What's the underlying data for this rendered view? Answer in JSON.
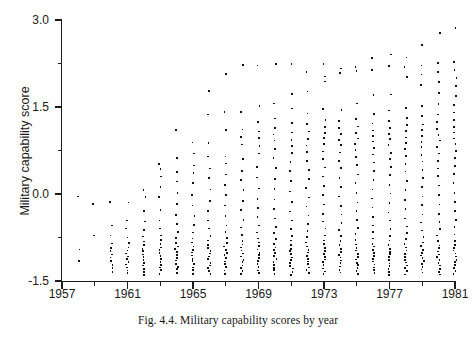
{
  "figure": {
    "caption": "Fig. 4.4. Military capability scores by year",
    "axis_color": "#1c1c1c",
    "dot_color": "#111111",
    "background": "#ffffff"
  },
  "chart_data": {
    "type": "scatter",
    "title": "",
    "xlabel": "",
    "ylabel": "Military capability score",
    "xlim": [
      1957,
      1981
    ],
    "ylim": [
      -1.5,
      3.0
    ],
    "grid": false,
    "legend": null,
    "x_major_ticks": [
      1957,
      1961,
      1965,
      1969,
      1973,
      1977,
      1981
    ],
    "x_major_tick_labels": [
      "1957",
      "1961",
      "1965",
      "1969",
      "1973",
      "1977",
      "1981"
    ],
    "x_minor_ticks": [
      1959,
      1963,
      1967,
      1971,
      1975,
      1979
    ],
    "y_major_ticks": [
      -1.5,
      0.0,
      1.5,
      3.0
    ],
    "y_major_tick_labels": [
      "-1.5",
      "0.0",
      "1.5",
      "3.0"
    ],
    "y_minor_ticks": [
      -0.75,
      0.75,
      2.25
    ],
    "series": [
      {
        "name": "Military capability score",
        "marker": "dot",
        "points_by_year": [
          {
            "year": 1958,
            "values": [
              -0.05,
              -0.95,
              -1.15
            ]
          },
          {
            "year": 1959,
            "values": [
              -0.17,
              -0.72
            ]
          },
          {
            "year": 1960,
            "values": [
              -0.13,
              -0.55,
              -0.72,
              -0.85,
              -0.92,
              -0.98,
              -1.04,
              -1.1,
              -1.16,
              -1.22,
              -1.28,
              -1.34
            ]
          },
          {
            "year": 1961,
            "values": [
              -0.15,
              -0.45,
              -0.6,
              -0.75,
              -0.85,
              -0.92,
              -0.98,
              -1.02,
              -1.07,
              -1.12,
              -1.17,
              -1.22,
              -1.27,
              -1.32,
              -1.37
            ]
          },
          {
            "year": 1962,
            "values": [
              0.07,
              -0.05,
              -0.3,
              -0.48,
              -0.62,
              -0.74,
              -0.82,
              -0.88,
              -0.94,
              -0.99,
              -1.04,
              -1.09,
              -1.14,
              -1.19,
              -1.24,
              -1.29,
              -1.34,
              -1.39
            ]
          },
          {
            "year": 1963,
            "values": [
              0.52,
              0.42,
              0.3,
              0.13,
              -0.06,
              -0.28,
              -0.46,
              -0.6,
              -0.72,
              -0.8,
              -0.86,
              -0.92,
              -0.97,
              -1.02,
              -1.07,
              -1.12,
              -1.17,
              -1.22,
              -1.27,
              -1.32,
              -1.38
            ]
          },
          {
            "year": 1964,
            "values": [
              1.1,
              0.62,
              0.38,
              0.22,
              0.02,
              -0.18,
              -0.36,
              -0.52,
              -0.66,
              -0.76,
              -0.84,
              -0.9,
              -0.95,
              -1.0,
              -1.05,
              -1.1,
              -1.15,
              -1.2,
              -1.25,
              -1.3,
              -1.36
            ]
          },
          {
            "year": 1965,
            "values": [
              0.88,
              0.7,
              0.5,
              0.35,
              0.18,
              -0.02,
              -0.2,
              -0.38,
              -0.54,
              -0.66,
              -0.76,
              -0.84,
              -0.9,
              -0.96,
              -1.01,
              -1.06,
              -1.11,
              -1.16,
              -1.21,
              -1.26,
              -1.31,
              -1.37
            ]
          },
          {
            "year": 1966,
            "values": [
              1.78,
              1.38,
              0.88,
              0.64,
              0.44,
              0.27,
              0.08,
              -0.12,
              -0.3,
              -0.46,
              -0.6,
              -0.72,
              -0.8,
              -0.87,
              -0.93,
              -0.98,
              -1.03,
              -1.08,
              -1.13,
              -1.18,
              -1.23,
              -1.28,
              -1.33,
              -1.38
            ]
          },
          {
            "year": 1967,
            "values": [
              2.08,
              1.42,
              1.1,
              0.65,
              0.52,
              0.34,
              0.16,
              -0.02,
              -0.2,
              -0.38,
              -0.54,
              -0.66,
              -0.76,
              -0.84,
              -0.9,
              -0.96,
              -1.01,
              -1.06,
              -1.11,
              -1.16,
              -1.21,
              -1.26,
              -1.31,
              -1.37
            ]
          },
          {
            "year": 1968,
            "values": [
              2.22,
              1.42,
              1.12,
              0.98,
              0.86,
              0.6,
              0.4,
              0.24,
              0.06,
              -0.12,
              -0.28,
              -0.44,
              -0.58,
              -0.7,
              -0.8,
              -0.87,
              -0.93,
              -0.98,
              -1.03,
              -1.08,
              -1.13,
              -1.18,
              -1.23,
              -1.28,
              -1.33,
              -1.38
            ]
          },
          {
            "year": 1969,
            "values": [
              2.22,
              1.52,
              1.24,
              1.08,
              0.96,
              0.82,
              0.7,
              0.46,
              0.28,
              0.1,
              -0.08,
              -0.24,
              -0.4,
              -0.54,
              -0.66,
              -0.76,
              -0.84,
              -0.9,
              -0.96,
              -1.01,
              -1.06,
              -1.11,
              -1.16,
              -1.21,
              -1.26,
              -1.31,
              -1.37
            ]
          },
          {
            "year": 1970,
            "values": [
              2.24,
              1.56,
              1.3,
              1.14,
              1.02,
              0.92,
              0.78,
              0.62,
              0.44,
              0.26,
              0.08,
              -0.1,
              -0.26,
              -0.42,
              -0.56,
              -0.68,
              -0.78,
              -0.86,
              -0.92,
              -0.97,
              -1.02,
              -1.07,
              -1.12,
              -1.17,
              -1.22,
              -1.27,
              -1.32,
              -1.38
            ]
          },
          {
            "year": 1971,
            "values": [
              2.24,
              1.72,
              1.48,
              1.22,
              1.06,
              0.94,
              0.82,
              0.7,
              0.56,
              0.4,
              0.22,
              0.04,
              -0.14,
              -0.3,
              -0.46,
              -0.6,
              -0.72,
              -0.81,
              -0.88,
              -0.94,
              -0.99,
              -1.04,
              -1.09,
              -1.14,
              -1.19,
              -1.24,
              -1.29,
              -1.34,
              -1.39
            ]
          },
          {
            "year": 1972,
            "values": [
              2.1,
              1.76,
              1.38,
              1.2,
              1.08,
              0.96,
              0.84,
              0.72,
              0.58,
              0.42,
              0.26,
              0.1,
              -0.06,
              -0.22,
              -0.38,
              -0.52,
              -0.64,
              -0.74,
              -0.83,
              -0.9,
              -0.96,
              -1.01,
              -1.06,
              -1.11,
              -1.16,
              -1.21,
              -1.26,
              -1.31,
              -1.36
            ]
          },
          {
            "year": 1973,
            "values": [
              2.24,
              2.02,
              1.94,
              1.46,
              1.28,
              1.16,
              1.06,
              0.96,
              0.86,
              0.74,
              0.6,
              0.46,
              0.3,
              0.14,
              -0.02,
              -0.18,
              -0.34,
              -0.48,
              -0.6,
              -0.71,
              -0.8,
              -0.87,
              -0.93,
              -0.98,
              -1.03,
              -1.08,
              -1.13,
              -1.18,
              -1.23,
              -1.28,
              -1.33,
              -1.38
            ]
          },
          {
            "year": 1974,
            "values": [
              2.16,
              2.08,
              1.44,
              1.26,
              1.14,
              1.04,
              0.94,
              0.84,
              0.72,
              0.58,
              0.44,
              0.28,
              0.12,
              -0.04,
              -0.2,
              -0.36,
              -0.5,
              -0.62,
              -0.73,
              -0.82,
              -0.89,
              -0.95,
              -1.0,
              -1.05,
              -1.1,
              -1.15,
              -1.2,
              -1.25,
              -1.3,
              -1.35
            ]
          },
          {
            "year": 1975,
            "values": [
              2.18,
              2.12,
              1.56,
              1.3,
              1.16,
              1.06,
              0.96,
              0.86,
              0.76,
              0.64,
              0.5,
              0.34,
              0.18,
              0.02,
              -0.14,
              -0.3,
              -0.44,
              -0.58,
              -0.7,
              -0.8,
              -0.87,
              -0.93,
              -0.98,
              -1.03,
              -1.08,
              -1.13,
              -1.18,
              -1.23,
              -1.28,
              -1.33,
              -1.38
            ]
          },
          {
            "year": 1976,
            "values": [
              2.34,
              2.14,
              1.7,
              1.38,
              1.22,
              1.1,
              1.0,
              0.9,
              0.8,
              0.68,
              0.54,
              0.4,
              0.24,
              0.08,
              -0.08,
              -0.24,
              -0.4,
              -0.54,
              -0.66,
              -0.77,
              -0.85,
              -0.91,
              -0.97,
              -1.02,
              -1.07,
              -1.12,
              -1.17,
              -1.22,
              -1.27,
              -1.32,
              -1.37
            ]
          },
          {
            "year": 1977,
            "values": [
              2.4,
              2.2,
              1.72,
              1.44,
              1.26,
              1.14,
              1.04,
              0.94,
              0.84,
              0.72,
              0.6,
              0.46,
              0.32,
              0.16,
              0.0,
              -0.16,
              -0.32,
              -0.46,
              -0.6,
              -0.72,
              -0.81,
              -0.88,
              -0.94,
              -0.99,
              -1.04,
              -1.09,
              -1.14,
              -1.19,
              -1.24,
              -1.29,
              -1.34,
              -1.39
            ]
          },
          {
            "year": 1978,
            "values": [
              2.36,
              2.18,
              2.02,
              1.48,
              1.3,
              1.18,
              1.08,
              0.98,
              0.88,
              0.78,
              0.66,
              0.52,
              0.38,
              0.22,
              0.06,
              -0.1,
              -0.26,
              -0.42,
              -0.56,
              -0.68,
              -0.78,
              -0.86,
              -0.92,
              -0.98,
              -1.03,
              -1.08,
              -1.13,
              -1.18,
              -1.23,
              -1.28,
              -1.33,
              -1.38
            ]
          },
          {
            "year": 1979,
            "values": [
              2.56,
              2.22,
              2.06,
              1.88,
              1.52,
              1.34,
              1.2,
              1.1,
              1.0,
              0.9,
              0.8,
              0.68,
              0.56,
              0.42,
              0.28,
              0.12,
              -0.04,
              -0.2,
              -0.36,
              -0.5,
              -0.63,
              -0.74,
              -0.83,
              -0.9,
              -0.96,
              -1.01,
              -1.06,
              -1.11,
              -1.16,
              -1.21,
              -1.26,
              -1.31,
              -1.36
            ]
          },
          {
            "year": 1980,
            "values": [
              2.78,
              2.26,
              2.1,
              1.94,
              1.74,
              1.56,
              1.38,
              1.24,
              1.12,
              1.02,
              0.92,
              0.82,
              0.7,
              0.58,
              0.44,
              0.3,
              0.14,
              -0.02,
              -0.18,
              -0.34,
              -0.48,
              -0.61,
              -0.72,
              -0.81,
              -0.88,
              -0.94,
              -0.99,
              -1.04,
              -1.09,
              -1.14,
              -1.19,
              -1.24,
              -1.29,
              -1.34,
              -1.39
            ]
          },
          {
            "year": 1981,
            "values": [
              2.86,
              2.28,
              2.14,
              2.0,
              1.86,
              1.7,
              1.54,
              1.4,
              1.28,
              1.16,
              1.06,
              0.96,
              0.86,
              0.74,
              0.62,
              0.48,
              0.34,
              0.18,
              0.02,
              -0.14,
              -0.3,
              -0.44,
              -0.58,
              -0.7,
              -0.8,
              -0.87,
              -0.93,
              -0.98,
              -1.03,
              -1.08,
              -1.13,
              -1.18,
              -1.23,
              -1.28,
              -1.33,
              -1.38
            ]
          }
        ]
      }
    ]
  }
}
